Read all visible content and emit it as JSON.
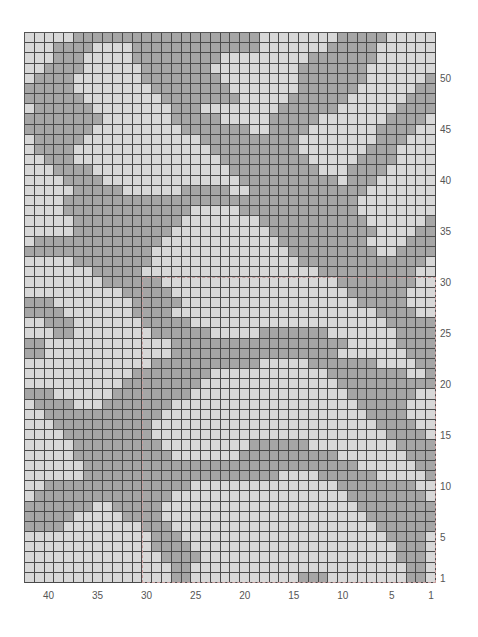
{
  "chart": {
    "title": "",
    "type": "knitting-colorwork-chart",
    "columns": 42,
    "rows": 54,
    "colors": {
      "light": "#d8d8d8",
      "dark": "#a6a6a6",
      "gridline": "#4a4a4a",
      "repeat_outline": "#c9a0a0"
    },
    "repeat_box": {
      "col_from": 1,
      "col_to": 30,
      "row_from": 1,
      "row_to": 30
    },
    "row_labels": [
      "1",
      "5",
      "10",
      "15",
      "20",
      "25",
      "30",
      "35",
      "40",
      "45",
      "50"
    ],
    "row_label_values": [
      1,
      5,
      10,
      15,
      20,
      25,
      30,
      35,
      40,
      45,
      50
    ],
    "col_labels": [
      "40",
      "35",
      "30",
      "25",
      "20",
      "15",
      "10",
      "5",
      "1"
    ],
    "col_label_values": [
      40,
      35,
      30,
      25,
      20,
      15,
      10,
      5,
      1
    ],
    "pattern_rows_top_to_bottom": [
      "000001111111111111111111000000001111100000",
      "000111100001111111111111000000011111000000",
      "000111000001111111110000000001111111000000",
      "001111000000111111100000000011111110000000",
      "011110000000111111110000000011111110000001",
      "111110000000011111111000000011111100000011",
      "111111000000001111111100000111111000000111",
      "011111100000000111000000001111110000001111",
      "111111110000000111110000011111000000011110",
      "111111100000000011111110011110000000111100",
      "011111000000000000111111111100000000111000",
      "011110000000000000011111111100000001110000",
      "001110000000000000001111111110000011110000",
      "000111100000000000000111111111000111100000",
      "000011110000000000000011111111110111000000",
      "000001111100000011111001111111111110000000",
      "000011111111111111111111111111111100000000",
      "000011111111111110000011111111111100000000",
      "000001111111111100000000111111111110000001",
      "000001111111111000000000011111111111000011",
      "011111111111110000000000001111111110000111",
      "111111111111100000000000000111111111001111",
      "000001111111100000000000000011111111111110",
      "000000011111000000000000000000111111111100",
      "000000001111110000000000000000001111111100",
      "000000000011111000000000000000000111111000",
      "111000000001111100000000000000000011111000",
      "111100000001111000000000000000000000111100",
      "001110000000111110000000000000000000011111",
      "000110000000011111100000111111100000001111",
      "110000000000000111111111111111111000001111",
      "110000000000000111111111111111110000000111",
      "000000000000011111111111000001111111000011",
      "000000000001111111100000000000011111111001",
      "000000000011111111000000000000001111111111",
      "111000000111111110000000000000000111111100",
      "011110001111111000000000000000000011111000",
      "001111111111110000000000000000000001111000",
      "000111111111100000000000000000000000111100",
      "000011111111100000000000000000000000011110",
      "000001111111110000000001111110000000001111",
      "000001111111111000000011111111110000000111",
      "000000111111111111111111111111111100000011",
      "000000111111111111111111110000111111000001",
      "001111111111111110000000000000001111111100",
      "011111111111111000000000000000000111111110",
      "111111100111110000000000000000000011111111",
      "111110000011110000000000000000000001111111",
      "111100000000111000000000000000000000111111",
      "000000000000011100000000000000000000011110",
      "000000000000011110000000000000000000001110",
      "000000000000001111000000000000000000001110",
      "000000000000000110000000000000000000000110",
      "000000000000000110000000000011100000000110"
    ]
  }
}
